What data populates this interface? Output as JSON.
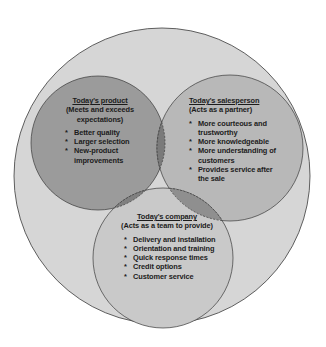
{
  "diagram": {
    "type": "venn",
    "colors": {
      "background": "#ffffff",
      "outer_circle": "#d6d6d6",
      "product_circle": "#9b9b9b",
      "salesperson_circle": "#b8b8b8",
      "company_circle": "#c9c9c9",
      "overlap": "#7a7a7a",
      "stroke": "#3a3a3a"
    },
    "product": {
      "title": "Today's product",
      "subtitle": "(Meets and exceeds expectations)",
      "items": [
        "Better quality",
        "Larger selection",
        "New-product improvements"
      ]
    },
    "salesperson": {
      "title": "Today's salesperson",
      "subtitle": "(Acts as a partner)",
      "items": [
        "More courteous and trustworthy",
        "More knowledgeable",
        "More understanding of customers",
        "Provides service after the sale"
      ]
    },
    "company": {
      "title": "Today's company",
      "subtitle": "(Acts as a team to provide)",
      "items": [
        "Delivery and installation",
        "Orientation and training",
        "Quick response times",
        "Credit options",
        "Customer service"
      ]
    }
  }
}
